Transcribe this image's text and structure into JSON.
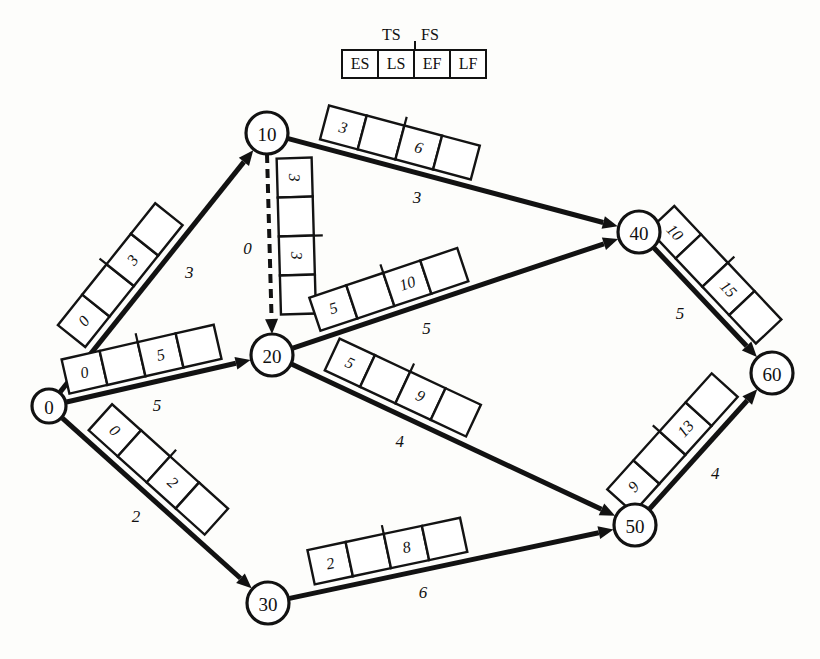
{
  "diagram": {
    "type": "activity-on-arrow-network",
    "title_legend": {
      "ts_label": "TS",
      "fs_label": "FS",
      "cells": [
        "ES",
        "LS",
        "EF",
        "LF"
      ]
    },
    "nodes": [
      {
        "id": "node-0",
        "label": "0",
        "cx": 49,
        "cy": 406,
        "r": 17
      },
      {
        "id": "node-10",
        "label": "10",
        "cx": 267,
        "cy": 133,
        "r": 21
      },
      {
        "id": "node-20",
        "label": "20",
        "cx": 272,
        "cy": 355,
        "r": 21
      },
      {
        "id": "node-30",
        "label": "30",
        "cx": 268,
        "cy": 603,
        "r": 21
      },
      {
        "id": "node-40",
        "label": "40",
        "cx": 639,
        "cy": 232,
        "r": 21
      },
      {
        "id": "node-50",
        "label": "50",
        "cx": 635,
        "cy": 525,
        "r": 21
      },
      {
        "id": "node-60",
        "label": "60",
        "cx": 772,
        "cy": 373,
        "r": 21
      }
    ],
    "edges": [
      {
        "id": "edge-0-10",
        "from": "0",
        "to": "10",
        "duration": "3",
        "dummy": false,
        "cells": [
          "0",
          "",
          "3",
          ""
        ],
        "x1": 49,
        "y1": 406,
        "x2": 267,
        "y2": 133,
        "box_offset": -26,
        "box_t": 0.42,
        "dur_offset": 26,
        "dur_t": 0.55
      },
      {
        "id": "edge-0-20",
        "from": "0",
        "to": "20",
        "duration": "5",
        "dummy": false,
        "cells": [
          "0",
          "",
          "5",
          ""
        ],
        "x1": 49,
        "y1": 406,
        "x2": 272,
        "y2": 355,
        "box_offset": -25,
        "box_t": 0.44,
        "dur_offset": 24,
        "dur_t": 0.46
      },
      {
        "id": "edge-0-30",
        "from": "0",
        "to": "30",
        "duration": "2",
        "dummy": false,
        "cells": [
          "0",
          "",
          "2",
          ""
        ],
        "x1": 49,
        "y1": 406,
        "x2": 268,
        "y2": 603,
        "box_offset": -26,
        "box_t": 0.42,
        "dur_offset": 24,
        "dur_t": 0.47
      },
      {
        "id": "edge-10-20-dummy",
        "from": "10",
        "to": "20",
        "duration": "0",
        "dummy": true,
        "cells": [
          "3",
          "",
          "3",
          ""
        ],
        "x1": 267,
        "y1": 154,
        "x2": 272,
        "y2": 334,
        "box_offset": -27,
        "box_t": 0.46,
        "dur_offset": 22,
        "dur_t": 0.52
      },
      {
        "id": "edge-10-40",
        "from": "10",
        "to": "40",
        "duration": "3",
        "dummy": false,
        "cells": [
          "3",
          "",
          "6",
          ""
        ],
        "x1": 267,
        "y1": 133,
        "x2": 639,
        "y2": 232,
        "box_offset": -25,
        "box_t": 0.34,
        "dur_offset": 24,
        "dur_t": 0.42
      },
      {
        "id": "edge-20-40",
        "from": "20",
        "to": "40",
        "duration": "5",
        "dummy": false,
        "cells": [
          "5",
          "",
          "10",
          ""
        ],
        "x1": 272,
        "y1": 355,
        "x2": 639,
        "y2": 232,
        "box_offset": -25,
        "box_t": 0.34,
        "dur_offset": 24,
        "dur_t": 0.4
      },
      {
        "id": "edge-20-50",
        "from": "20",
        "to": "50",
        "duration": "4",
        "dummy": false,
        "cells": [
          "5",
          "",
          "9",
          ""
        ],
        "x1": 272,
        "y1": 355,
        "x2": 635,
        "y2": 525,
        "box_offset": -26,
        "box_t": 0.33,
        "dur_offset": 24,
        "dur_t": 0.38
      },
      {
        "id": "edge-30-50",
        "from": "30",
        "to": "50",
        "duration": "6",
        "dummy": false,
        "cells": [
          "2",
          "",
          "8",
          ""
        ],
        "x1": 268,
        "y1": 603,
        "x2": 635,
        "y2": 525,
        "box_offset": -26,
        "box_t": 0.34,
        "dur_offset": 22,
        "dur_t": 0.41
      },
      {
        "id": "edge-40-60",
        "from": "40",
        "to": "60",
        "duration": "5",
        "dummy": false,
        "cells": [
          "10",
          "",
          "15",
          ""
        ],
        "x1": 639,
        "y1": 232,
        "x2": 772,
        "y2": 373,
        "box_offset": -26,
        "box_t": 0.43,
        "dur_offset": 26,
        "dur_t": 0.45
      },
      {
        "id": "edge-50-60",
        "from": "50",
        "to": "60",
        "duration": "4",
        "dummy": false,
        "cells": [
          "9",
          "",
          "13",
          ""
        ],
        "x1": 635,
        "y1": 525,
        "x2": 772,
        "y2": 373,
        "box_offset": -27,
        "box_t": 0.42,
        "dur_offset": 25,
        "dur_t": 0.45
      }
    ]
  }
}
